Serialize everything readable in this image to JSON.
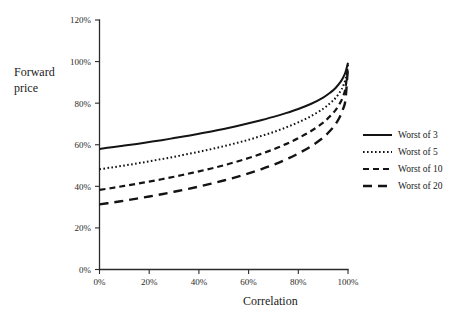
{
  "chart_data": {
    "type": "line",
    "title": "",
    "xlabel": "Correlation",
    "ylabel": "Forward price",
    "xlim": [
      0,
      100
    ],
    "ylim": [
      0,
      120
    ],
    "grid": false,
    "legend_position": "right",
    "x_tick_labels": [
      "0%",
      "20%",
      "40%",
      "60%",
      "80%",
      "100%"
    ],
    "x_ticks": [
      0,
      20,
      40,
      60,
      80,
      100
    ],
    "y_tick_labels": [
      "0%",
      "20%",
      "40%",
      "60%",
      "80%",
      "100%",
      "120%"
    ],
    "y_ticks": [
      0,
      20,
      40,
      60,
      80,
      100,
      120
    ],
    "x": [
      0,
      5,
      10,
      15,
      20,
      25,
      30,
      35,
      40,
      45,
      50,
      55,
      60,
      65,
      70,
      75,
      80,
      85,
      90,
      93,
      95,
      97,
      98,
      99,
      100
    ],
    "series": [
      {
        "name": "Worst of 3",
        "style": "solid",
        "values": [
          58.0,
          58.8,
          59.6,
          60.4,
          61.3,
          62.2,
          63.2,
          64.2,
          65.3,
          66.4,
          67.6,
          68.9,
          70.3,
          71.8,
          73.4,
          75.2,
          77.2,
          79.6,
          82.7,
          85.2,
          87.3,
          90.2,
          92.2,
          95.0,
          99.4
        ]
      },
      {
        "name": "Worst of 5",
        "style": "dotted",
        "values": [
          48.2,
          49.1,
          50.0,
          51.0,
          52.0,
          53.1,
          54.2,
          55.4,
          56.6,
          57.9,
          59.3,
          60.8,
          62.4,
          64.2,
          66.1,
          68.3,
          70.8,
          73.7,
          77.3,
          80.2,
          82.5,
          85.8,
          88.2,
          91.6,
          98.8
        ]
      },
      {
        "name": "Worst of 10",
        "style": "dashed-short",
        "values": [
          38.3,
          39.2,
          40.2,
          41.2,
          42.3,
          43.4,
          44.6,
          45.9,
          47.2,
          48.6,
          50.1,
          51.8,
          53.6,
          55.6,
          57.8,
          60.3,
          63.2,
          66.5,
          70.6,
          74.0,
          76.7,
          80.5,
          83.3,
          87.3,
          98.3
        ]
      },
      {
        "name": "Worst of 20",
        "style": "dashed-long",
        "values": [
          31.3,
          32.2,
          33.1,
          34.1,
          35.1,
          36.2,
          37.4,
          38.6,
          39.9,
          41.3,
          42.8,
          44.4,
          46.2,
          48.2,
          50.4,
          52.9,
          55.8,
          59.2,
          63.4,
          67.0,
          69.9,
          74.1,
          77.2,
          81.8,
          98.0
        ]
      }
    ]
  },
  "axes": {
    "y_axis_title_line1": "Forward",
    "y_axis_title_line2": "price",
    "x_axis_title": "Correlation"
  },
  "legend": {
    "items": [
      {
        "label": "Worst of 3",
        "style": "solid"
      },
      {
        "label": "Worst of 5",
        "style": "dotted"
      },
      {
        "label": "Worst of 10",
        "style": "dashed-short"
      },
      {
        "label": "Worst of 20",
        "style": "dashed-long"
      }
    ]
  },
  "colors": {
    "line": "#141414",
    "axis": "#2b2b2b",
    "text": "#1a1a1a",
    "background": "#ffffff"
  }
}
